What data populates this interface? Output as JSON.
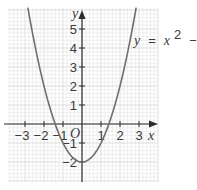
{
  "chart_data": {
    "type": "line",
    "title": "",
    "equation_label": "y = x² − 2",
    "equation_parts": {
      "lhs": "y",
      "eq": "=",
      "var": "x",
      "exp": "2",
      "rest": "− 2"
    },
    "xlabel": "x",
    "ylabel": "y",
    "origin_label": "O",
    "xlim": [
      -3.9,
      3.9
    ],
    "ylim": [
      -3.1,
      6.1
    ],
    "x_ticks": [
      -3,
      -2,
      -1,
      1,
      2,
      3
    ],
    "x_tick_labels": [
      "−3",
      "−2",
      "−1",
      "1",
      "2",
      "3"
    ],
    "y_ticks": [
      -2,
      -1,
      1,
      2,
      3,
      4,
      5
    ],
    "y_tick_labels": [
      "−2",
      "−1",
      "1",
      "2",
      "3",
      "4",
      "5"
    ],
    "grid": true,
    "grid_minor_step": 0.2,
    "series": [
      {
        "name": "y = x² − 2",
        "function": "x^2 - 2",
        "x": [
          -2.85,
          -2.5,
          -2,
          -1.5,
          -1,
          -0.5,
          0,
          0.5,
          1,
          1.5,
          2,
          2.5,
          2.85
        ],
        "y": [
          6.12,
          4.25,
          2,
          0.25,
          -1,
          -1.75,
          -2,
          -1.75,
          -1,
          0.25,
          2,
          4.25,
          6.12
        ],
        "color": "#6e6e6e"
      }
    ],
    "colors": {
      "curve": "#6e6e6e",
      "axes": "#2b2b2b",
      "grid_minor": "#e4e4e4",
      "grid_major": "#c9c9c9"
    }
  }
}
